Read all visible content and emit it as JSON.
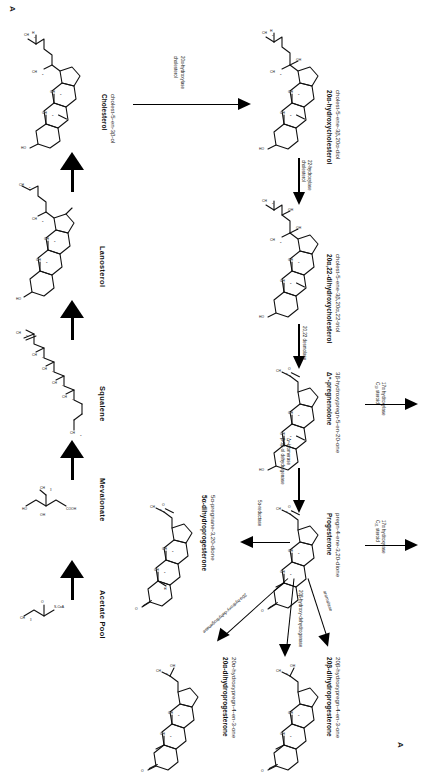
{
  "figure": {
    "plate_letter_topleft": "A",
    "plate_letter_bottomright": "A",
    "orientation_note": "rotated-90"
  },
  "left_column": {
    "nodes": [
      {
        "id": "acetate-pool",
        "name": "Acetate Pool",
        "formula_note": "CH3 C O S CoA"
      },
      {
        "id": "mevalonate",
        "name": "Mevalonate",
        "formula_note": "CH3 OH COOH"
      },
      {
        "id": "squalene",
        "name": "Squalene",
        "formula_note": "CH3"
      },
      {
        "id": "lanosterol",
        "name": "Lanosterol",
        "formula_note": "CH3"
      },
      {
        "id": "cholesterol",
        "name": "Cholesterol",
        "systematic": "cholest-5-en-3β-ol"
      }
    ]
  },
  "right_column": {
    "nodes": [
      {
        "id": "20a-hydroxycholesterol",
        "name": "20α-hydroxycholesterol",
        "systematic": "cholest-5-ene-3β,20α-diol"
      },
      {
        "id": "20a-22-dihydroxycholesterol",
        "name": "20α,22-dihydroxycholesterol",
        "systematic": "cholest-5-ene-3β,20α,22-triol"
      },
      {
        "id": "delta5-pregnenolone",
        "name": "Δ⁵-pregnenolone",
        "systematic": "3β-hydroxypregn-5-en-20-one"
      },
      {
        "id": "progesterone",
        "name": "Progesterone",
        "systematic": "pregn-4-ene-3,20-dione"
      }
    ]
  },
  "bottom_nodes": [
    {
      "id": "5a-dihydroprogesterone",
      "name": "5α-dihydroprogesterone",
      "systematic": "5α-pregnane-3,20-dione"
    },
    {
      "id": "20a-dihydroprogesterone",
      "name": "20α-dihydroprogesterone",
      "systematic": "20α-hydroxypregn-4-en-3-one"
    },
    {
      "id": "20b-dihydroprogesterone",
      "name": "20β-dihydroprogesterone",
      "systematic": "20β-hydroxypregn-4-en-3-one"
    }
  ],
  "enzymes": {
    "cholesterol_20a_hydroxylase": {
      "line1": "cholesterol",
      "line2": "20α-hydroxylase"
    },
    "cholesterol_22_hydroxylase": {
      "line1": "cholesterol",
      "line2": "22-hydroxylase"
    },
    "desmolase_20_22": {
      "line1": "20,22 desmolase",
      "line2": ""
    },
    "dehydrogenase_isomerase": {
      "line1": "β-3β-ol dehydrogenase",
      "line2": "Δ⁵-isomerase"
    },
    "five_alpha_reductase": {
      "line1": "5α-reductase",
      "line2": ""
    },
    "c19_steroid_17a_hydroxylase": {
      "line1": "C₁₉ steroid",
      "line2": "17α hydroxylase"
    },
    "c21_steroid_17a_hydroxylase": {
      "line1": "C₂₁ steroid",
      "line2": "17α hydroxylase"
    },
    "dehydrogenase_20a": {
      "line1": "20α-hydroxy-dehydrogenase",
      "line2": ""
    },
    "dehydrogenase_20b": {
      "line1": "20β-hydroxy-dehydrogenase",
      "line2": ""
    },
    "aromatase": {
      "line1": "aromatase",
      "line2": ""
    }
  },
  "atom_labels": {
    "ch3": "CH3",
    "oh": "OH",
    "o": "O",
    "ho": "HO",
    "coa": "S-CoA",
    "cooh": "COOH"
  },
  "colors": {
    "ink": "#111111",
    "paper": "#ffffff",
    "sub_ink": "#2b2b2b"
  }
}
